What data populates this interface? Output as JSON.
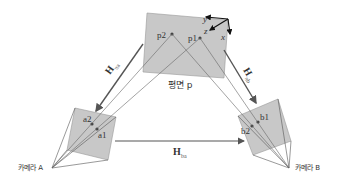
{
  "diagram": {
    "title": "",
    "plane": {
      "label": "평면 p",
      "points": [
        "p1",
        "p2"
      ],
      "axes": [
        "x",
        "y",
        "z"
      ]
    },
    "camera_a": {
      "label": "카메라 A",
      "points": [
        "a1",
        "a2"
      ]
    },
    "camera_b": {
      "label": "카메라 B",
      "points": [
        "b1",
        "b2"
      ]
    },
    "homographies": [
      {
        "id": "H_pa",
        "symbol": "H",
        "subscript": "πa",
        "from": "plane p",
        "to": "camera A"
      },
      {
        "id": "H_pb",
        "symbol": "H",
        "subscript": "πb",
        "from": "plane p",
        "to": "camera B"
      },
      {
        "id": "H_ba",
        "symbol": "H",
        "subscript": "ba",
        "from": "camera A",
        "to": "camera B"
      }
    ],
    "colors": {
      "plane_fill": "#c8c8c8",
      "line": "#555555",
      "arrow": "#666666"
    }
  }
}
